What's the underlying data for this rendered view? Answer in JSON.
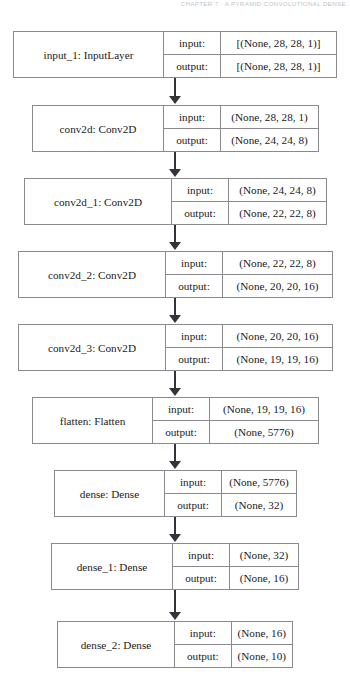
{
  "page": {
    "header_text": "CHAPTER 7  ·  A PYRAMID CONVOLUTIONAL DENSE",
    "background_color": "#ffffff",
    "line_color": "#8a8a8e",
    "arrow_color": "#33333a"
  },
  "diagram": {
    "type": "keras-model-plot",
    "io_labels": {
      "input": "input:",
      "output": "output:"
    },
    "layers": [
      {
        "id": "input_1",
        "name": "input_1: InputLayer",
        "input_shape": "[(None, 28, 28, 1)]",
        "output_shape": "[(None, 28, 28, 1)]",
        "box": {
          "left": 13,
          "top": 31,
          "width": 324,
          "name_width": 150,
          "io_width": 57
        }
      },
      {
        "id": "conv2d",
        "name": "conv2d: Conv2D",
        "input_shape": "(None, 28, 28, 1)",
        "output_shape": "(None, 24, 24, 8)",
        "box": {
          "left": 32,
          "top": 105,
          "width": 287,
          "name_width": 131,
          "io_width": 57
        }
      },
      {
        "id": "conv2d_1",
        "name": "conv2d_1: Conv2D",
        "input_shape": "(None, 24, 24, 8)",
        "output_shape": "(None, 22, 22, 8)",
        "box": {
          "left": 24,
          "top": 178,
          "width": 303,
          "name_width": 147,
          "io_width": 57
        }
      },
      {
        "id": "conv2d_2",
        "name": "conv2d_2: Conv2D",
        "input_shape": "(None, 22, 22, 8)",
        "output_shape": "(None, 20, 20, 16)",
        "box": {
          "left": 18,
          "top": 251,
          "width": 315,
          "name_width": 147,
          "io_width": 57
        }
      },
      {
        "id": "conv2d_3",
        "name": "conv2d_3: Conv2D",
        "input_shape": "(None, 20, 20, 16)",
        "output_shape": "(None, 19, 19, 16)",
        "box": {
          "left": 18,
          "top": 324,
          "width": 315,
          "name_width": 147,
          "io_width": 57
        }
      },
      {
        "id": "flatten",
        "name": "flatten: Flatten",
        "input_shape": "(None, 19, 19, 16)",
        "output_shape": "(None, 5776)",
        "box": {
          "left": 32,
          "top": 397,
          "width": 287,
          "name_width": 120,
          "io_width": 57
        }
      },
      {
        "id": "dense",
        "name": "dense: Dense",
        "input_shape": "(None, 5776)",
        "output_shape": "(None, 32)",
        "box": {
          "left": 54,
          "top": 470,
          "width": 243,
          "name_width": 110,
          "io_width": 57
        }
      },
      {
        "id": "dense_1",
        "name": "dense_1: Dense",
        "input_shape": "(None, 32)",
        "output_shape": "(None, 16)",
        "box": {
          "left": 51,
          "top": 543,
          "width": 248,
          "name_width": 121,
          "io_width": 57
        }
      },
      {
        "id": "dense_2",
        "name": "dense_2: Dense",
        "input_shape": "(None, 16)",
        "output_shape": "(None, 10)",
        "box": {
          "left": 57,
          "top": 621,
          "width": 236,
          "name_width": 118,
          "io_width": 57
        }
      }
    ],
    "connectors": [
      {
        "from": "input_1",
        "to": "conv2d",
        "top": 78,
        "height": 19
      },
      {
        "from": "conv2d",
        "to": "conv2d_1",
        "top": 152,
        "height": 18
      },
      {
        "from": "conv2d_1",
        "to": "conv2d_2",
        "top": 225,
        "height": 18
      },
      {
        "from": "conv2d_2",
        "to": "conv2d_3",
        "top": 298,
        "height": 18
      },
      {
        "from": "conv2d_3",
        "to": "flatten",
        "top": 371,
        "height": 18
      },
      {
        "from": "flatten",
        "to": "dense",
        "top": 444,
        "height": 18
      },
      {
        "from": "dense",
        "to": "dense_1",
        "top": 517,
        "height": 18
      },
      {
        "from": "dense_1",
        "to": "dense_2",
        "top": 590,
        "height": 23
      }
    ]
  }
}
